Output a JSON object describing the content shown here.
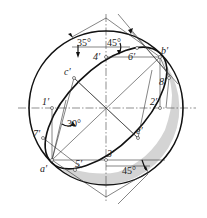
{
  "figure": {
    "colors": {
      "outline": "#111111",
      "construction": "#333333",
      "shade": "#d4d4d4",
      "background": "#ffffff"
    },
    "angles": {
      "top_left": "35°",
      "top_middle": "45°",
      "left": "30°",
      "bottom_right": "45°"
    },
    "points": {
      "a": "a′",
      "b": "b′",
      "c": "c′",
      "e": "e′",
      "p1": "1′",
      "p2": "2′",
      "p3": "3′",
      "p4": "4′",
      "p5": "5′",
      "p6": "6′",
      "p7": "7′",
      "p8": "8′"
    }
  }
}
